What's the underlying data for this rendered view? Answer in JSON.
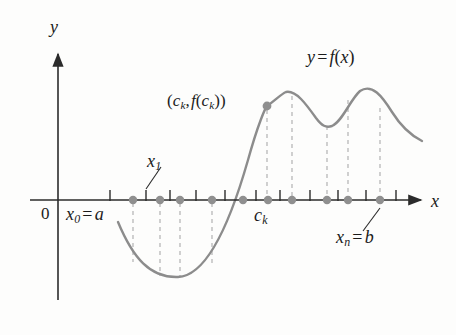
{
  "figure": {
    "background": "#fdfdfc"
  },
  "axes": {
    "x_axis_label": "x",
    "y_axis_label": "y",
    "origin_label": "0",
    "axis_color": "#2b2b2b",
    "x_axis_y": 200,
    "y_axis_x": 58,
    "x_axis_start": 30,
    "x_axis_end": 425,
    "y_axis_top": 50,
    "y_axis_bottom": 300
  },
  "curve": {
    "label": "y = f(x)",
    "label_parts": {
      "y": "y",
      "equals": "=",
      "f": "f",
      "open": "(",
      "x": "x",
      "close": ")"
    },
    "color": "#8c8c8c",
    "width": 2.4,
    "path": "M 118 222 C 133 258 150 278 178 277 C 205 276 228 230 248 160 C 258 124 266 106 267 106 C 276 100 281 94 286 92 C 296 90 306 104 316 118 C 322 126 326 128 332 126 C 342 122 350 100 360 91 C 372 83 382 96 392 112 C 402 128 412 136 422 141"
  },
  "markers": {
    "dot_color": "#8f8f8f",
    "dot_radius": 4.2,
    "partition_points": [
      {
        "name": "x0",
        "x": 133
      },
      {
        "name": "x1",
        "x": 160
      },
      {
        "name": "x2",
        "x": 180
      },
      {
        "name": "x3",
        "x": 212
      },
      {
        "name": "x4",
        "x": 243
      },
      {
        "name": "x5",
        "x": 268
      },
      {
        "name": "x6",
        "x": 292
      },
      {
        "name": "x7",
        "x": 327
      },
      {
        "name": "x8",
        "x": 348
      },
      {
        "name": "xn",
        "x": 380
      }
    ],
    "highlight_point": {
      "name": "ck-point",
      "x": 267,
      "y": 106
    }
  },
  "ticks": {
    "color": "#2b2b2b",
    "height": 11,
    "positions": [
      110,
      146,
      170,
      196,
      225,
      256,
      280,
      310,
      338,
      366,
      396
    ]
  },
  "dashed_lines": {
    "color": "#b8b8b8",
    "dash": "4 4",
    "segments": [
      {
        "x": 133,
        "y1": 203,
        "y2": 262
      },
      {
        "x": 160,
        "y1": 203,
        "y2": 276
      },
      {
        "x": 180,
        "y1": 203,
        "y2": 277
      },
      {
        "x": 212,
        "y1": 203,
        "y2": 266
      },
      {
        "x": 267,
        "y1": 110,
        "y2": 197
      },
      {
        "x": 292,
        "y1": 96,
        "y2": 197
      },
      {
        "x": 327,
        "y1": 126,
        "y2": 197
      },
      {
        "x": 348,
        "y1": 100,
        "y2": 197
      },
      {
        "x": 380,
        "y1": 108,
        "y2": 197
      }
    ]
  },
  "leaders": {
    "color": "#2b2b2b",
    "lines": [
      {
        "name": "x1-leader",
        "x1": 146,
        "y1": 189,
        "x2": 160,
        "y2": 168
      },
      {
        "name": "xnb-leader",
        "x1": 380,
        "y1": 209,
        "x2": 364,
        "y2": 230
      }
    ]
  },
  "labels": {
    "y_axis": "y",
    "x_axis": "x",
    "origin": "0",
    "x0_equals_a": {
      "var": "x",
      "sub": "0",
      "op": "=",
      "value": "a"
    },
    "x1": {
      "var": "x",
      "sub": "1"
    },
    "ck": {
      "var": "c",
      "sub": "k"
    },
    "xn_equals_b": {
      "var": "x",
      "sub": "n",
      "op": "=",
      "value": "b"
    },
    "point_ck": {
      "open": "(",
      "c": "c",
      "c_sub": "k",
      "comma": ",",
      "f": "f",
      "inner_open": "(",
      "inner_c": "c",
      "inner_sub": "k",
      "inner_close": ")",
      "close": ")"
    },
    "function": {
      "y": "y",
      "equals": "=",
      "f": "f",
      "open": "(",
      "x": "x",
      "close": ")"
    }
  }
}
